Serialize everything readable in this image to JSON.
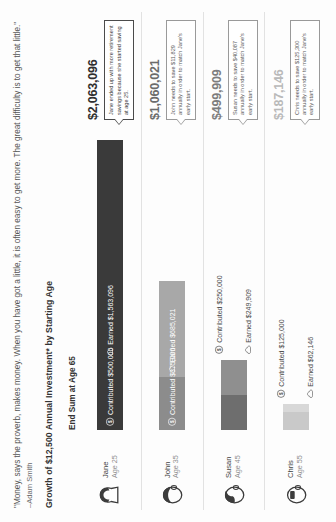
{
  "quote": {
    "text": "\"Money, says the proverb, makes money. When you have got a little, it is often easy to get more. The great difficulty is to get that little.\"",
    "attribution": "–Adam Smith"
  },
  "chart_title": "Growth of $12,500 Annual Investment* by Starting Age",
  "columns": {
    "end_sum_header": "End Sum at Age 65"
  },
  "footnote": "",
  "colors": {
    "contributed_jane": "#3a3a3a",
    "earned_jane": "#3a3a3a",
    "contributed_john": "#8c8c8c",
    "earned_john": "#a8a8a8",
    "contributed_susan": "#6e6e6e",
    "earned_susan": "#8f8f8f",
    "contributed_chris": "#c9c9c9",
    "earned_chris": "#d8d8d8",
    "callout_border": "#9a9a9a",
    "callout_border_strong": "#4b4b4b",
    "text": "#3a3a3a"
  },
  "chart_data": {
    "type": "bar",
    "title": "Growth of $12,500 Annual Investment* by Starting Age",
    "subtitle": "End Sum at Age 65",
    "xlabel": "",
    "ylabel": "",
    "stacked": true,
    "orientation": "horizontal",
    "categories": [
      "Jane",
      "John",
      "Susan",
      "Chris"
    ],
    "series": [
      {
        "name": "Contributed",
        "values": [
          500000,
          375000,
          250000,
          125000
        ]
      },
      {
        "name": "Earned",
        "values": [
          1563096,
          685021,
          249909,
          62146
        ]
      }
    ],
    "totals": [
      2063096,
      1060021,
      499909,
      187146
    ],
    "xlim": [
      0,
      2063096
    ],
    "grid": false,
    "legend": "inline-labels"
  },
  "rows": [
    {
      "name": "Jane",
      "age_label": "Age 25",
      "avatar": "person-female-icon",
      "contributed_label": "Contributed $500,000",
      "earned_label": "Earned $1,563,096",
      "contributed_value": 500000,
      "earned_value": 1563096,
      "end_sum": "$2,063,096",
      "callout": "Jane ended up with more retirement savings because she started saving at age 25."
    },
    {
      "name": "John",
      "age_label": "Age 35",
      "avatar": "person-male-icon",
      "contributed_label": "Contributed $375,000",
      "earned_label": "Earned $685,021",
      "contributed_value": 375000,
      "earned_value": 685021,
      "end_sum": "$1,060,021",
      "callout": "John needs to save $11,829 annually in order to match Jane's early start."
    },
    {
      "name": "Susan",
      "age_label": "Age 45",
      "avatar": "person-female2-icon",
      "contributed_label": "Contributed $250,000",
      "earned_label": "Earned $249,909",
      "contributed_value": 250000,
      "earned_value": 249909,
      "end_sum": "$499,909",
      "callout": "Susan needs to save $40,087 annually in order to match Jane's early start."
    },
    {
      "name": "Chris",
      "age_label": "Age 55",
      "avatar": "person-male2-icon",
      "contributed_label": "Contributed $125,000",
      "earned_label": "Earned $62,146",
      "contributed_value": 125000,
      "earned_value": 62146,
      "end_sum": "$187,146",
      "callout": "Chris needs to save $125,300 annually in order to match Jane's early start."
    }
  ],
  "icons": {
    "contributed": "dollar-circle-icon",
    "earned": "cloud-growth-icon"
  }
}
